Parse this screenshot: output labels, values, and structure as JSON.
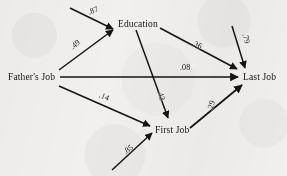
{
  "figure": {
    "type": "path-diagram",
    "background_color": "#f1f0ee",
    "ink_color": "#151515"
  },
  "nodes": [
    {
      "id": "fathers_job",
      "label": "Father's Job",
      "x": 8,
      "y": 72
    },
    {
      "id": "education",
      "label": "Education",
      "x": 118,
      "y": 19
    },
    {
      "id": "first_job",
      "label": "First Job",
      "x": 155,
      "y": 125
    },
    {
      "id": "last_job",
      "label": "Last Job",
      "x": 243,
      "y": 72
    }
  ],
  "paths": [
    {
      "id": "p-res-education",
      "coefficient": ".87",
      "from": "residual",
      "to": "education",
      "label_x": 88,
      "label_y": 6,
      "rotate": -22
    },
    {
      "id": "p-father-education",
      "coefficient": ".49",
      "from": "fathers_job",
      "to": "education",
      "label_x": 70,
      "label_y": 40,
      "rotate": -40
    },
    {
      "id": "p-education-last",
      "coefficient": ".36",
      "from": "education",
      "to": "last_job",
      "label_x": 192,
      "label_y": 40,
      "rotate": 26
    },
    {
      "id": "p-res-last",
      "coefficient": ".79",
      "from": "residual",
      "to": "last_job",
      "label_x": 241,
      "label_y": 34,
      "rotate": 74
    },
    {
      "id": "p-father-last",
      "coefficient": ".08",
      "from": "fathers_job",
      "to": "last_job",
      "label_x": 180,
      "label_y": 63,
      "rotate": 0
    },
    {
      "id": "p-education-first",
      "coefficient": ".43",
      "from": "education",
      "to": "first_job",
      "label_x": 156,
      "label_y": 91,
      "rotate": 74
    },
    {
      "id": "p-father-first",
      "coefficient": ".14",
      "from": "fathers_job",
      "to": "first_job",
      "label_x": 99,
      "label_y": 92,
      "rotate": 22
    },
    {
      "id": "p-first-last",
      "coefficient": ".29",
      "from": "first_job",
      "to": "last_job",
      "label_x": 206,
      "label_y": 101,
      "rotate": -72
    },
    {
      "id": "p-res-first",
      "coefficient": ".85",
      "from": "residual",
      "to": "first_job",
      "label_x": 123,
      "label_y": 145,
      "rotate": -38
    }
  ]
}
